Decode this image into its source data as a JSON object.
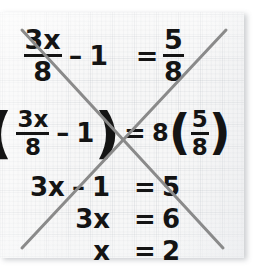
{
  "document": {
    "kind": "scanned-worksheet",
    "medium": "graph-paper",
    "annotation": "crossed-out",
    "paper_color": "#f7f7f7",
    "grid_color": "#a5acb4",
    "ink_color": "#141414",
    "crossout_color": "#8a8a8a"
  },
  "work": {
    "lines": [
      {
        "id": "line-1",
        "text": "3x/8 - 1 = 5/8",
        "lhs": {
          "frac_num": "3x",
          "frac_den": "8",
          "operator": "–",
          "term": "1"
        },
        "equals": "=",
        "rhs": {
          "frac_num": "5",
          "frac_den": "8"
        }
      },
      {
        "id": "line-2",
        "text": "8(3x/8 - 1) = 8(5/8)",
        "lhs": {
          "coefficient": "8",
          "open_paren": "(",
          "frac_num": "3x",
          "frac_den": "8",
          "operator": "–",
          "term": "1",
          "close_paren": ")"
        },
        "equals": "=",
        "rhs": {
          "coefficient": "8",
          "open_paren": "(",
          "frac_num": "5",
          "frac_den": "8",
          "close_paren": ")"
        }
      },
      {
        "id": "line-3",
        "text": "3x - 1 = 5",
        "lhs": {
          "term": "3x",
          "operator": "–",
          "constant": "1"
        },
        "equals": "=",
        "rhs": {
          "value": "5"
        }
      },
      {
        "id": "line-4",
        "text": "3x = 6",
        "lhs": {
          "term": "3x"
        },
        "equals": "=",
        "rhs": {
          "value": "6"
        }
      },
      {
        "id": "line-5",
        "text": "x = 2",
        "lhs": {
          "term": "x"
        },
        "equals": "=",
        "rhs": {
          "value": "2"
        }
      }
    ]
  },
  "crossout": {
    "name": "x-crossout-mark",
    "stroke_width": 3,
    "color": "#8a8a8a",
    "strokes": [
      {
        "name": "stroke-ascending",
        "x1": 22,
        "y1": 248,
        "x2": 226,
        "y2": 30
      },
      {
        "name": "stroke-descending",
        "x1": 22,
        "y1": 30,
        "x2": 223,
        "y2": 248
      }
    ],
    "intersection": {
      "x": 123,
      "y": 140
    }
  }
}
